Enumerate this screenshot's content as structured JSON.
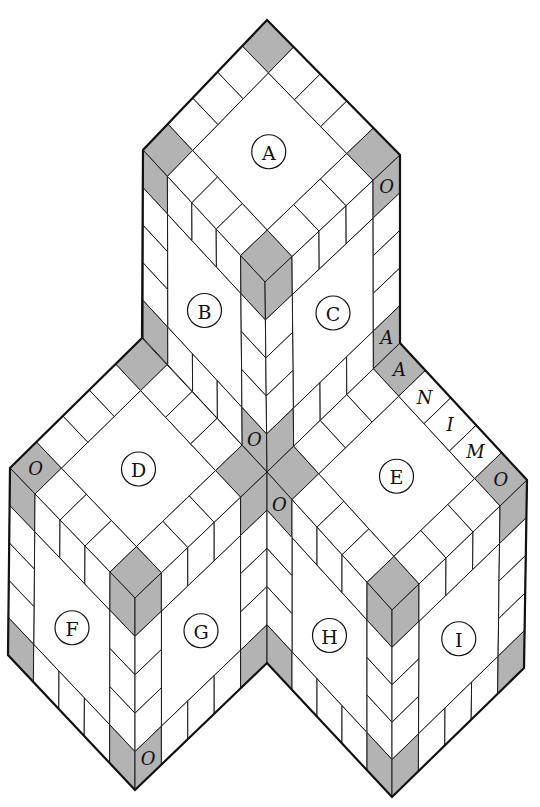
{
  "diagram": {
    "title": "",
    "colors": {
      "grey": "#b3b3b3",
      "white": "#ffffff",
      "line": "#1a1a1a"
    },
    "grid_divisions": 5,
    "faces": [
      {
        "id": "A",
        "label": "A",
        "pts": [
          [
            267,
            20
          ],
          [
            400,
            155
          ],
          [
            265,
            282
          ],
          [
            143,
            150
          ]
        ]
      },
      {
        "id": "B",
        "label": "B",
        "pts": [
          [
            143,
            150
          ],
          [
            265,
            282
          ],
          [
            267,
            472
          ],
          [
            143,
            338
          ]
        ]
      },
      {
        "id": "C",
        "label": "C",
        "pts": [
          [
            265,
            282
          ],
          [
            400,
            155
          ],
          [
            400,
            343
          ],
          [
            267,
            472
          ]
        ]
      },
      {
        "id": "D",
        "label": "D",
        "pts": [
          [
            142,
            338
          ],
          [
            267,
            472
          ],
          [
            135,
            598
          ],
          [
            10,
            468
          ]
        ]
      },
      {
        "id": "E",
        "label": "E",
        "pts": [
          [
            400,
            343
          ],
          [
            527,
            480
          ],
          [
            392,
            610
          ],
          [
            267,
            472
          ]
        ]
      },
      {
        "id": "F",
        "label": "F",
        "pts": [
          [
            10,
            468
          ],
          [
            135,
            598
          ],
          [
            135,
            790
          ],
          [
            8,
            655
          ]
        ]
      },
      {
        "id": "G",
        "label": "G",
        "pts": [
          [
            135,
            598
          ],
          [
            267,
            472
          ],
          [
            267,
            663
          ],
          [
            135,
            790
          ]
        ]
      },
      {
        "id": "H",
        "label": "H",
        "pts": [
          [
            267,
            472
          ],
          [
            392,
            610
          ],
          [
            392,
            797
          ],
          [
            267,
            663
          ]
        ]
      },
      {
        "id": "I",
        "label": "I",
        "pts": [
          [
            392,
            610
          ],
          [
            527,
            480
          ],
          [
            524,
            668
          ],
          [
            392,
            797
          ]
        ]
      }
    ],
    "cell_letters": [
      {
        "face": "B",
        "i": 4,
        "j": 4,
        "text": "O"
      },
      {
        "face": "C",
        "i": 0,
        "j": 4,
        "text": "O"
      },
      {
        "face": "C",
        "i": 4,
        "j": 4,
        "text": "A"
      },
      {
        "face": "D",
        "i": 4,
        "j": 0,
        "text": "O"
      },
      {
        "face": "E",
        "i": 0,
        "j": 4,
        "text": "O"
      },
      {
        "face": "E",
        "i": 0,
        "j": 3,
        "text": "M"
      },
      {
        "face": "E",
        "i": 0,
        "j": 2,
        "text": "I"
      },
      {
        "face": "E",
        "i": 0,
        "j": 1,
        "text": "N"
      },
      {
        "face": "E",
        "i": 0,
        "j": 0,
        "text": "A"
      },
      {
        "face": "G",
        "i": 4,
        "j": 0,
        "text": "O"
      },
      {
        "face": "H",
        "i": 0,
        "j": 0,
        "text": "O"
      }
    ],
    "outline": [
      [
        267,
        20
      ],
      [
        400,
        155
      ],
      [
        400,
        343
      ],
      [
        527,
        480
      ],
      [
        524,
        668
      ],
      [
        392,
        797
      ],
      [
        267,
        663
      ],
      [
        135,
        790
      ],
      [
        8,
        655
      ],
      [
        10,
        468
      ],
      [
        142,
        338
      ],
      [
        143,
        150
      ]
    ]
  }
}
